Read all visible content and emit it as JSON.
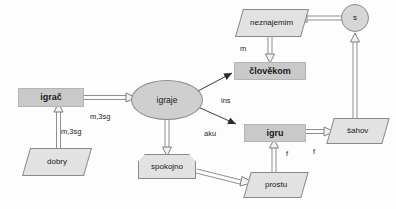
{
  "diagram": {
    "colors": {
      "background": "#fdfdfd",
      "rect_fill": "#c9c9c9",
      "shape_fill": "#e2e2e2",
      "ellipse_fill": "#cfcfcf",
      "circle_fill": "#d6d6d6",
      "stroke": "#8a8a8a",
      "text": "#1a1a1a"
    },
    "nodes": [
      {
        "id": "igrac",
        "label": "igrač",
        "shape": "rectangle"
      },
      {
        "id": "dobry",
        "label": "dobry",
        "shape": "parallelogram"
      },
      {
        "id": "igraje",
        "label": "igraje",
        "shape": "ellipse"
      },
      {
        "id": "spokojno",
        "label": "spokojno",
        "shape": "pentagon"
      },
      {
        "id": "clovekom",
        "label": "člověkom",
        "shape": "rectangle"
      },
      {
        "id": "neznajemim",
        "label": "neznajemim",
        "shape": "parallelogram"
      },
      {
        "id": "igru",
        "label": "igru",
        "shape": "rectangle"
      },
      {
        "id": "sahov",
        "label": "šahov",
        "shape": "parallelogram"
      },
      {
        "id": "prostu",
        "label": "prostu",
        "shape": "parallelogram"
      },
      {
        "id": "s",
        "label": "s",
        "shape": "circle"
      }
    ],
    "edge_labels": [
      {
        "id": "lbl-m3sg-top",
        "text": "m,3sg"
      },
      {
        "id": "lbl-m3sg-bot",
        "text": "m,3sg"
      },
      {
        "id": "lbl-ins",
        "text": "ins"
      },
      {
        "id": "lbl-aku",
        "text": "aku"
      },
      {
        "id": "lbl-m",
        "text": "m"
      },
      {
        "id": "lbl-f-left",
        "text": "f"
      },
      {
        "id": "lbl-f-right",
        "text": "f"
      }
    ]
  }
}
